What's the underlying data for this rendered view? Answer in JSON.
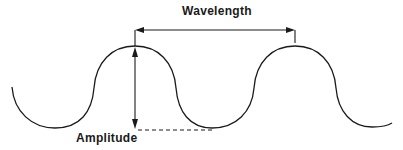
{
  "diagram": {
    "labels": {
      "wavelength": "Wavelength",
      "amplitude": "Amplitude"
    },
    "colors": {
      "stroke": "#1a1a1a",
      "background": "#ffffff"
    },
    "elements": [
      {
        "type": "wave",
        "description": "sinusoidal wave with two crests"
      },
      {
        "type": "double-arrow",
        "label": "Wavelength",
        "from": "crest 1",
        "to": "crest 2",
        "orientation": "horizontal"
      },
      {
        "type": "double-arrow",
        "label": "Amplitude",
        "from": "crest",
        "to": "trough level",
        "orientation": "vertical"
      },
      {
        "type": "dashed-line",
        "description": "trough reference level"
      }
    ]
  }
}
